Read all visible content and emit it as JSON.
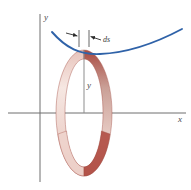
{
  "figure": {
    "name": "surface-of-revolution-arc-element",
    "background_color": "#ffffff",
    "width": 191,
    "height": 190
  },
  "axes": {
    "x_label": "x",
    "y_label": "y",
    "axis_color": "#6e6e6e",
    "x_axis_y": 113,
    "y_axis_x": 40,
    "x_axis_start": 8,
    "x_axis_end": 186,
    "y_axis_top": 14,
    "y_axis_bottom": 182
  },
  "curve": {
    "label": "generating-curve",
    "color": "#2f62a8",
    "stroke_width": 1.8,
    "description": "upward-opening parabolic curve above the x-axis",
    "path": "M 52 32 C 74 52, 96 56, 120 52 C 144 48, 166 40, 182 30"
  },
  "arc_element": {
    "label": "ds",
    "color": "#3a3a3a",
    "tick_left_x": 78,
    "tick_right_x": 90,
    "tick_top_y": 30,
    "tick_bottom_y": 46,
    "arrow_color": "#2b2b2b"
  },
  "height_segment": {
    "label": "y",
    "color": "#8a8a8a",
    "x": 84,
    "top_y": 50,
    "bottom_y": 113
  },
  "band": {
    "label": "revolved-band",
    "description": "elliptical ribbon swept by revolving the arc element about the y-axis",
    "center_x": 84,
    "center_y": 113,
    "radius_x": 28,
    "radius_y": 63,
    "band_thickness": 9,
    "colors": {
      "dark_red": "#a34a42",
      "mid_red": "#c5786e",
      "light_pink": "#f0d6d0",
      "highlight": "#faeeea",
      "edge_line": "#9c4a42"
    }
  },
  "colors": {
    "curve_blue": "#2f62a8",
    "band_red": "#a34a42",
    "band_pink": "#f0d6d0",
    "axis_gray": "#6e6e6e",
    "text_gray": "#4a4a4a"
  }
}
